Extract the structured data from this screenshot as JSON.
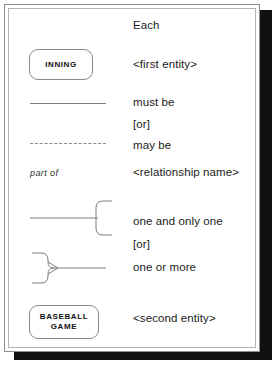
{
  "figure": {
    "title_row": "Each",
    "accent_color": "#8a8a8a",
    "text_color": "#1a1a1a",
    "shadow_color": "#111111"
  },
  "rows": [
    {
      "key": "each",
      "symbol": "none",
      "label": "Each"
    },
    {
      "key": "first_entity",
      "symbol": "entity-box",
      "label": "<first entity>",
      "entity_name": "INNING"
    },
    {
      "key": "must_be",
      "symbol": "solid-line",
      "label": "must be"
    },
    {
      "key": "or_1",
      "symbol": "none",
      "label": "[or]"
    },
    {
      "key": "may_be",
      "symbol": "dashed-line",
      "label": "may be"
    },
    {
      "key": "relationship",
      "symbol": "relationship-label",
      "label": "<relationship name>",
      "relationship_name": "part of"
    },
    {
      "key": "one_and_only_one",
      "symbol": "one-and-only-one",
      "label": "one and only one"
    },
    {
      "key": "or_2",
      "symbol": "none",
      "label": "[or]"
    },
    {
      "key": "one_or_more",
      "symbol": "crows-foot",
      "label": "one or more"
    },
    {
      "key": "second_entity",
      "symbol": "entity-box",
      "label": "<second entity>",
      "entity_name_line1": "BASEBALL",
      "entity_name_line2": "GAME"
    }
  ]
}
